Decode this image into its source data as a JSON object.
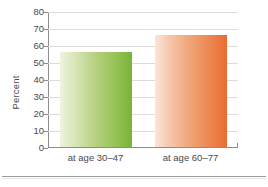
{
  "chart_data": {
    "type": "bar",
    "title": "",
    "xlabel": "",
    "ylabel": "Percent",
    "categories": [
      "at age 30–47",
      "at age 60–77"
    ],
    "values": [
      56,
      66
    ],
    "ylim": [
      0,
      80
    ],
    "ytick_step": 10,
    "yticks": [
      "0",
      "10",
      "20",
      "30",
      "40",
      "50",
      "60",
      "70",
      "80"
    ],
    "grid": true,
    "legend": "none",
    "series": [
      {
        "name": "Percent",
        "values": [
          56,
          66
        ]
      }
    ],
    "colors": {
      "bar_0_light": "#eef3e0",
      "bar_0_dark": "#79b33b",
      "bar_1_light": "#fbe5d8",
      "bar_1_dark": "#ea6c31",
      "gridline": "#dcdcdc",
      "axis": "#8c8c8c",
      "text": "#4a4a4a",
      "background": "#ffffff"
    }
  }
}
